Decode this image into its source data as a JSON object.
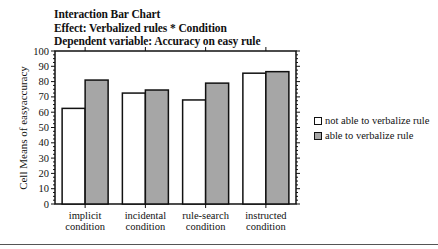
{
  "chart_data": {
    "type": "bar",
    "title": "Interaction Bar Chart",
    "subtitle_lines": [
      "Effect: Verbalized rules * Condition",
      "Dependent variable: Accuracy on easy rule"
    ],
    "xlabel": "",
    "ylabel": "Cell Means of easyaccuracy",
    "ylim": [
      0,
      100
    ],
    "yticks": [
      0,
      10,
      20,
      30,
      40,
      50,
      60,
      70,
      80,
      90,
      100
    ],
    "grid": false,
    "legend_position": "right",
    "categories": [
      "implicit condition",
      "incidental condition",
      "rule-search condition",
      "instructed condition"
    ],
    "category_lines": [
      [
        "implicit",
        "condition"
      ],
      [
        "incidental",
        "condition"
      ],
      [
        "rule-search",
        "condition"
      ],
      [
        "instructed",
        "condition"
      ]
    ],
    "series": [
      {
        "name": "not able to verbalize rule",
        "color": "#ffffff",
        "values": [
          62.5,
          72.5,
          68,
          85.5
        ]
      },
      {
        "name": "able to verbalize  rule",
        "color": "#a6a6a6",
        "values": [
          81,
          74.5,
          79,
          86.5
        ]
      }
    ]
  },
  "header": {
    "title": "Interaction Bar Chart",
    "effect": "Effect: Verbalized rules * Condition",
    "dependent": "Dependent variable: Accuracy on easy rule"
  },
  "axis": {
    "ylabel": "Cell Means of easyaccuracy"
  },
  "legend": {
    "items": [
      {
        "label": "not able to verbalize rule",
        "color": "#ffffff"
      },
      {
        "label": "able to verbalize  rule",
        "color": "#a6a6a6"
      }
    ]
  }
}
